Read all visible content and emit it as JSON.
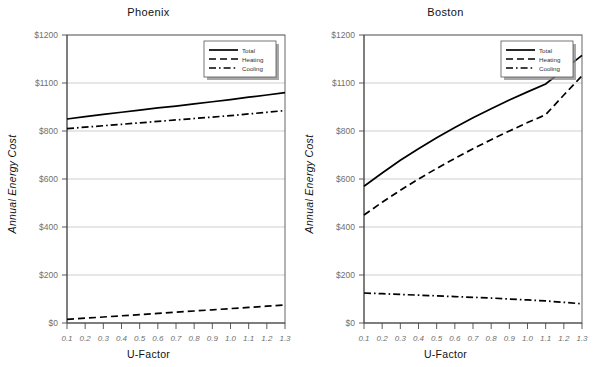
{
  "figure": {
    "ylabel": "Annual Energy Cost",
    "xlabel": "U-Factor"
  },
  "legend": {
    "total_label": "Total",
    "heating_label": "Heating",
    "cooling_label": "Cooling"
  },
  "axis": {
    "y_ticks": [
      "$0",
      "$200",
      "$400",
      "$600",
      "$800",
      "$1100",
      "$1200"
    ],
    "x_ticks": [
      "0.1",
      "0.2",
      "0.3",
      "0.4",
      "0.5",
      "0.6",
      "0.7",
      "0.8",
      "0.9",
      "1.0",
      "1.1",
      "1.2",
      "1.3"
    ]
  },
  "panels": [
    {
      "title": "Phoenix"
    },
    {
      "title": "Boston"
    }
  ],
  "chart_data": [
    {
      "type": "line",
      "title": "Phoenix",
      "xlabel": "U-Factor",
      "ylabel": "Annual Energy Cost",
      "x": [
        0.1,
        0.2,
        0.3,
        0.4,
        0.5,
        0.6,
        0.7,
        0.8,
        0.9,
        1.0,
        1.1,
        1.2,
        1.3
      ],
      "xlim": [
        0.1,
        1.3
      ],
      "ylim": [
        0,
        1200
      ],
      "ytick_values": [
        0,
        200,
        400,
        600,
        800,
        1000,
        1200
      ],
      "ytick_labels": [
        "$0",
        "$200",
        "$400",
        "$600",
        "$800",
        "$1100",
        "$1200"
      ],
      "grid": true,
      "legend_position": "upper right",
      "series": [
        {
          "name": "Total",
          "style": "solid",
          "values": [
            850,
            860,
            869,
            878,
            887,
            896,
            904,
            913,
            922,
            931,
            941,
            950,
            960
          ]
        },
        {
          "name": "Heating",
          "style": "dashed",
          "values": [
            15,
            20,
            25,
            30,
            35,
            40,
            45,
            50,
            55,
            60,
            65,
            70,
            75
          ]
        },
        {
          "name": "Cooling",
          "style": "dashdot",
          "values": [
            810,
            816,
            822,
            828,
            834,
            840,
            846,
            852,
            858,
            864,
            871,
            878,
            885
          ]
        }
      ]
    },
    {
      "type": "line",
      "title": "Boston",
      "xlabel": "U-Factor",
      "ylabel": "Annual Energy Cost",
      "x": [
        0.1,
        0.2,
        0.3,
        0.4,
        0.5,
        0.6,
        0.7,
        0.8,
        0.9,
        1.0,
        1.1,
        1.2,
        1.3
      ],
      "xlim": [
        0.1,
        1.3
      ],
      "ylim": [
        0,
        1200
      ],
      "ytick_values": [
        0,
        200,
        400,
        600,
        800,
        1000,
        1200
      ],
      "ytick_labels": [
        "$0",
        "$200",
        "$400",
        "$600",
        "$800",
        "$1100",
        "$1200"
      ],
      "grid": true,
      "legend_position": "upper right",
      "series": [
        {
          "name": "Total",
          "style": "solid",
          "values": [
            570,
            625,
            678,
            726,
            772,
            815,
            855,
            893,
            929,
            963,
            996,
            1056,
            1115
          ]
        },
        {
          "name": "Heating",
          "style": "dashed",
          "values": [
            450,
            503,
            553,
            600,
            644,
            686,
            726,
            764,
            800,
            835,
            868,
            950,
            1030
          ]
        },
        {
          "name": "Cooling",
          "style": "dashdot",
          "values": [
            125,
            122,
            119,
            116,
            113,
            110,
            107,
            104,
            100,
            96,
            92,
            86,
            80
          ]
        }
      ]
    }
  ]
}
